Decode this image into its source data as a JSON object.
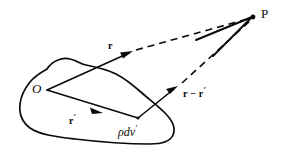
{
  "figure": {
    "background_color": "#ffffff",
    "stroke_color": "#0a0a0a",
    "width": 281,
    "height": 155
  },
  "labels": {
    "field_point": "P",
    "origin": "O",
    "vector_r": "r",
    "vector_r_prime_base": "r",
    "vector_r_prime_mark": "′",
    "vector_r_minus_rprime": "r − r",
    "vector_r_minus_rprime_mark": "′",
    "source_element": "ρdv",
    "source_element_mark": "′"
  },
  "geometry": {
    "origin_point": [
      47,
      90
    ],
    "source_point": [
      138,
      118
    ],
    "field_point": [
      253,
      17
    ],
    "r_solid_end": [
      128,
      54
    ],
    "r_arrow_tip": [
      131,
      52
    ],
    "r_dashed_start": [
      137,
      50
    ],
    "rmr_solid_start": [
      138,
      118
    ],
    "rmr_arrow_tip": [
      175,
      88
    ],
    "rmr_dashed_start": [
      181,
      83
    ],
    "rprime_arrow_tip": [
      100,
      112
    ]
  },
  "elements": {
    "blob": "closed-irregular-region",
    "vector_r_style": "solid-with-arrowhead-then-dashed",
    "vector_rprime_style": "solid-with-midpoint-arrowhead",
    "vector_r_minus_rprime_style": "solid-with-arrowhead-then-dashed"
  }
}
